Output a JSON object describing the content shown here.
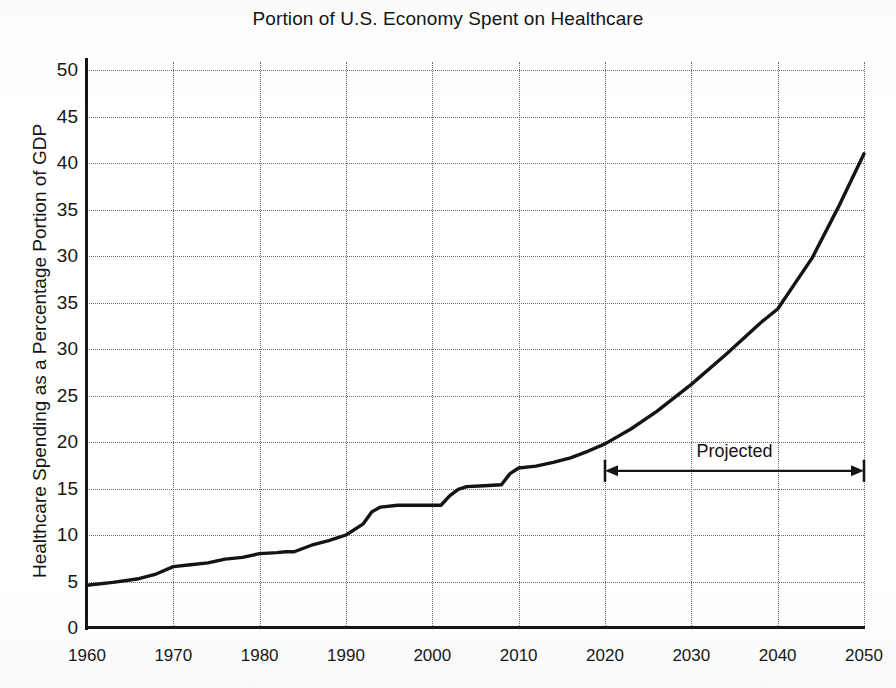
{
  "chart_data": {
    "type": "line",
    "title": "Portion of U.S. Economy Spent on Healthcare",
    "xlabel": "",
    "ylabel": "Healthcare Spending as a Percentage Portion of GDP",
    "xlim": [
      1960,
      2050
    ],
    "ylim": [
      0,
      52
    ],
    "grid": true,
    "legend": false,
    "x_tick_labels": [
      "1960",
      "1970",
      "1980",
      "1990",
      "2000",
      "2010",
      "2020",
      "2030",
      "2040",
      "2050"
    ],
    "x_tick_values": [
      1960,
      1970,
      1980,
      1990,
      2000,
      2010,
      2020,
      2030,
      2040,
      2050
    ],
    "y_tick_labels": [
      "50",
      "45",
      "40",
      "35",
      "30",
      "35",
      "30",
      "25",
      "20",
      "15",
      "10",
      "5",
      "0"
    ],
    "y_tick_positions": [
      60,
      55,
      50,
      45,
      40,
      35,
      30,
      25,
      20,
      15,
      10,
      5,
      0
    ],
    "y_tick_note": "Printed labels read 50,45,40,35,30,35,30,25,20,15,10,5,0 top-to-bottom; the sixth and seventh labels repeat 35 and 30 as printed.",
    "series": [
      {
        "name": "Healthcare spending as share of GDP",
        "color": "#141414",
        "x": [
          1960,
          1963,
          1966,
          1968,
          1970,
          1972,
          1974,
          1976,
          1978,
          1980,
          1982,
          1983,
          1984,
          1986,
          1988,
          1990,
          1992,
          1993,
          1994,
          1996,
          1998,
          2000,
          2001,
          2002,
          2003,
          2004,
          2006,
          2008,
          2009,
          2010,
          2012,
          2014,
          2016,
          2018,
          2020,
          2023,
          2026,
          2030,
          2034,
          2038,
          2040,
          2044,
          2047,
          2050
        ],
        "values": [
          4.6,
          4.9,
          5.3,
          5.8,
          6.6,
          6.8,
          7.0,
          7.4,
          7.6,
          8.0,
          8.1,
          8.2,
          8.2,
          8.9,
          9.4,
          10.0,
          11.2,
          12.5,
          13.0,
          13.2,
          13.2,
          13.2,
          13.2,
          14.2,
          14.9,
          15.2,
          15.3,
          15.4,
          16.6,
          17.2,
          17.4,
          17.8,
          18.3,
          19.0,
          19.8,
          21.4,
          23.3,
          26.2,
          29.4,
          32.8,
          34.3,
          39.8,
          45.2,
          51.0
        ]
      }
    ],
    "annotations": [
      {
        "type": "double-arrow",
        "label": "Projected",
        "x_start": 2020,
        "x_end": 2050,
        "y": 16.9,
        "label_y": 18.9
      }
    ]
  }
}
